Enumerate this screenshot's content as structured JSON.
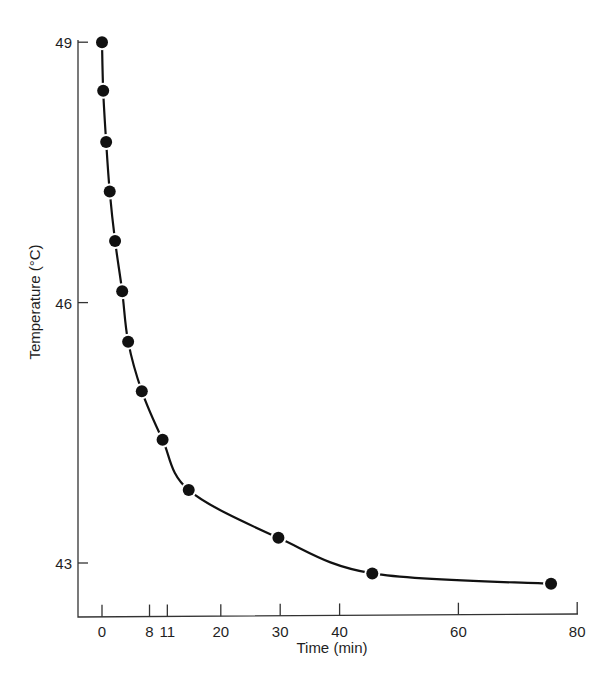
{
  "chart_data": {
    "type": "scatter",
    "title": "",
    "xlabel": "Time (min)",
    "ylabel": "Temperature (°C)",
    "xlim": [
      -4,
      80
    ],
    "ylim": [
      42.4,
      49
    ],
    "grid": false,
    "legend": null,
    "x_ticks": [
      0,
      8,
      11,
      20,
      30,
      40,
      60,
      80
    ],
    "x_tick_labels": [
      "0",
      "8",
      "11",
      "20",
      "30",
      "40",
      "60",
      "80"
    ],
    "y_ticks": [
      43,
      46,
      49
    ],
    "y_tick_labels": [
      "43",
      "46",
      "49"
    ],
    "series": [
      {
        "name": "Temperature",
        "marker": "filled-circle",
        "line": "smooth-fitted-curve",
        "x": [
          0,
          0.2,
          0.7,
          1.3,
          2.2,
          3.4,
          4.4,
          6.7,
          10.2,
          14.6,
          29.7,
          45.5,
          75.6
        ],
        "y": [
          49.0,
          48.44,
          47.85,
          47.28,
          46.71,
          46.13,
          45.55,
          44.98,
          44.42,
          43.84,
          43.29,
          42.88,
          42.76
        ]
      }
    ],
    "colors": {
      "line": "#111111",
      "marker": "#111111",
      "axis": "#333333"
    }
  }
}
